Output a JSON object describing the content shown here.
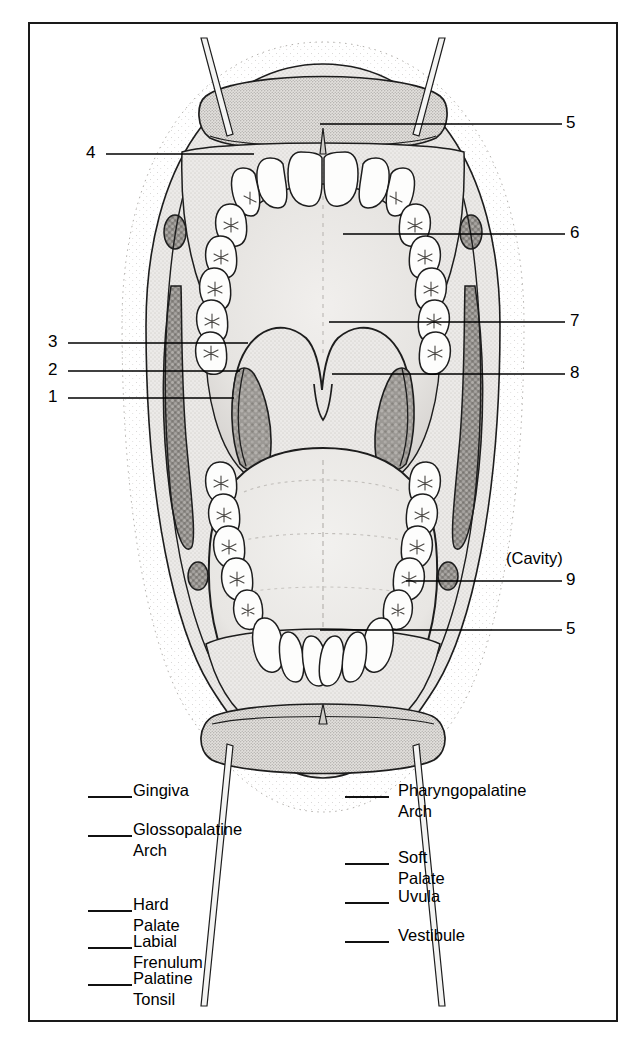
{
  "figure": {
    "title_visible": false,
    "callouts": [
      {
        "id": "c4",
        "number": "4",
        "side": "left",
        "x": 90,
        "y": 153,
        "line_x1": 104,
        "line_x2": 252,
        "line_y": 152
      },
      {
        "id": "c3",
        "number": "3",
        "side": "left",
        "x": 52,
        "y": 342,
        "line_x1": 66,
        "line_x2": 246,
        "line_y": 341
      },
      {
        "id": "c2",
        "number": "2",
        "side": "left",
        "x": 52,
        "y": 370,
        "line_x1": 66,
        "line_x2": 238,
        "line_y": 369
      },
      {
        "id": "c1",
        "number": "1",
        "side": "left",
        "x": 52,
        "y": 397,
        "line_x1": 66,
        "line_x2": 232,
        "line_y": 396
      },
      {
        "id": "c5t",
        "number": "5",
        "side": "right",
        "x": 569,
        "y": 123,
        "line_x1": 318,
        "line_x2": 560,
        "line_y": 122
      },
      {
        "id": "c6",
        "number": "6",
        "side": "right",
        "x": 573,
        "y": 233,
        "line_x1": 341,
        "line_x2": 563,
        "line_y": 232
      },
      {
        "id": "c7",
        "number": "7",
        "side": "right",
        "x": 573,
        "y": 321,
        "line_x1": 327,
        "line_x2": 563,
        "line_y": 320
      },
      {
        "id": "c8",
        "number": "8",
        "side": "right",
        "x": 573,
        "y": 373,
        "line_x1": 330,
        "line_x2": 563,
        "line_y": 372
      },
      {
        "id": "c9",
        "number": "9",
        "side": "right",
        "x": 569,
        "y": 580,
        "line_x1": 404,
        "line_x2": 560,
        "line_y": 579
      },
      {
        "id": "c5b",
        "number": "5",
        "side": "right",
        "x": 569,
        "y": 629,
        "line_x1": 318,
        "line_x2": 560,
        "line_y": 628
      }
    ],
    "cavity_note": {
      "text": "(Cavity)",
      "x": 506,
      "y": 558
    }
  },
  "legend": {
    "left_column": [
      {
        "label": "Gingiva",
        "blank_x": 88,
        "text_x": 133,
        "y": 789
      },
      {
        "label": "Glossopalatine\nArch",
        "blank_x": 88,
        "text_x": 133,
        "y": 828
      },
      {
        "label": "Hard Palate",
        "blank_x": 88,
        "text_x": 133,
        "y": 903
      },
      {
        "label": "Labial Frenulum",
        "blank_x": 88,
        "text_x": 133,
        "y": 940
      },
      {
        "label": "Palatine Tonsil",
        "blank_x": 88,
        "text_x": 133,
        "y": 977
      }
    ],
    "right_column": [
      {
        "label": "Pharyngopalatine\nArch",
        "blank_x": 345,
        "text_x": 398,
        "y": 789
      },
      {
        "label": "Soft Palate",
        "blank_x": 345,
        "text_x": 398,
        "y": 856
      },
      {
        "label": "Uvula",
        "blank_x": 345,
        "text_x": 398,
        "y": 895
      },
      {
        "label": "Vestibule",
        "blank_x": 345,
        "text_x": 398,
        "y": 934
      }
    ]
  },
  "colors": {
    "ink": "#1a1a1a",
    "frame": "#1a1a1a",
    "tissue_light": "#e9e8e6",
    "tissue_mid": "#d6d4d1",
    "tissue_dark": "#b9b6b2",
    "mucosa_gray": "#8f8c88",
    "tooth_white": "#fdfdfc",
    "paper": "#ffffff"
  }
}
